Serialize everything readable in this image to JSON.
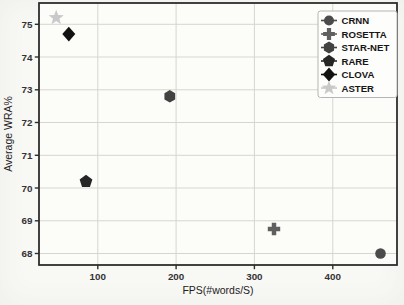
{
  "figure": {
    "background": "#f8f8f5",
    "plot_background": "#fcfcf9",
    "axis_color": "#2e2e2e",
    "grid_color": "#d6d6d1",
    "tick_label_color": "#333333",
    "axis_label_color": "#222222",
    "legend": {
      "background": "#fdfdfb",
      "border_color": "#b5b5b5",
      "text_color": "#161616"
    }
  },
  "chart_data": {
    "type": "scatter",
    "title": "",
    "xlabel": "FPS(#words/S)",
    "ylabel": "Average WRA%",
    "xlim": [
      25,
      482
    ],
    "ylim": [
      67.65,
      75.65
    ],
    "xticks": [
      100,
      200,
      300,
      400
    ],
    "yticks": [
      68,
      69,
      70,
      71,
      72,
      73,
      74,
      75
    ],
    "grid": true,
    "legend_position": "upper right",
    "series": [
      {
        "name": "CRNN",
        "marker": "circle",
        "color": "#4b4b4b",
        "points": [
          [
            461,
            68.0
          ]
        ]
      },
      {
        "name": "ROSETTA",
        "marker": "plus",
        "color": "#5f5f5f",
        "points": [
          [
            325,
            68.75
          ]
        ]
      },
      {
        "name": "STAR-NET",
        "marker": "hexagon",
        "color": "#424242",
        "points": [
          [
            192,
            72.8
          ]
        ]
      },
      {
        "name": "RARE",
        "marker": "pentagon",
        "color": "#262626",
        "points": [
          [
            85,
            70.2
          ]
        ]
      },
      {
        "name": "CLOVA",
        "marker": "diamond",
        "color": "#121212",
        "points": [
          [
            63,
            74.7
          ]
        ]
      },
      {
        "name": "ASTER",
        "marker": "star",
        "color": "#c9c9c9",
        "points": [
          [
            47,
            75.2
          ]
        ]
      }
    ]
  }
}
